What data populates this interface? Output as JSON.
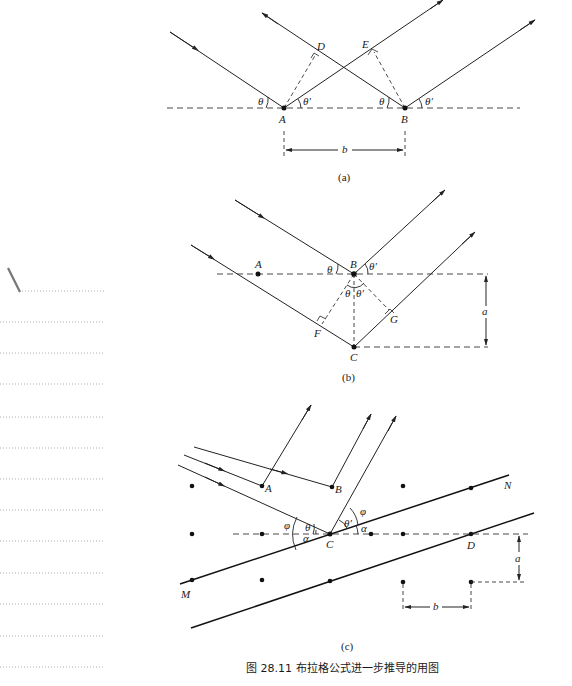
{
  "figure": {
    "caption_number": "图 28.11",
    "caption_text": "布拉格公式进一步推导的用图",
    "panels": [
      {
        "id": "a",
        "label": "(a)",
        "points": [
          "A",
          "B",
          "D",
          "E"
        ],
        "angles": [
          "θ",
          "θ'",
          "θ",
          "θ'"
        ],
        "dimension": "b"
      },
      {
        "id": "b",
        "label": "(b)",
        "points": [
          "A",
          "B",
          "C",
          "F",
          "G"
        ],
        "angles": [
          "θ",
          "θ'",
          "θ",
          "θ'"
        ],
        "dimension": "a"
      },
      {
        "id": "c",
        "label": "(c)",
        "points": [
          "A",
          "B",
          "C",
          "D",
          "M",
          "N"
        ],
        "angles": [
          "φ",
          "θ",
          "α",
          "θ'",
          "φ",
          "α"
        ],
        "dimensions": [
          "a",
          "b"
        ]
      }
    ]
  },
  "labels": {
    "a": {
      "A": "A",
      "B": "B",
      "D": "D",
      "E": "E",
      "theta": "θ",
      "theta_prime": "θ'",
      "b": "b",
      "panel": "(a)"
    },
    "b": {
      "A": "A",
      "B": "B",
      "C": "C",
      "F": "F",
      "G": "G",
      "theta": "θ",
      "theta_prime": "θ'",
      "a": "a",
      "panel": "(b)"
    },
    "c": {
      "A": "A",
      "B": "B",
      "C": "C",
      "D": "D",
      "M": "M",
      "N": "N",
      "phi": "φ",
      "theta": "θ",
      "theta_prime": "θ'",
      "alpha": "α",
      "a": "a",
      "b": "b",
      "panel": "(c)"
    }
  },
  "margin": {
    "dotted_lines": 13
  },
  "colors": {
    "ink": "#1a1a1a",
    "background": "#ffffff",
    "margin_dots": "#999999"
  }
}
